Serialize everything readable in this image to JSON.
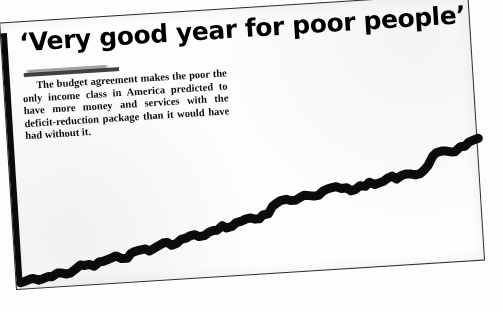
{
  "document": {
    "type": "newspaper-clipping-scan",
    "headline": "‘Very good year for poor people’",
    "byline": "",
    "byline_state": "smudged-illegible",
    "body_text": "The budget agreement makes the poor the only income class in America predicted to have more money and services with the deficit-reduction package than it would have had without it.",
    "background_color": "#fdfdfb",
    "paper_color": "#fefefe",
    "ink_color": "#0b0b0b"
  },
  "chart_data": {
    "type": "line",
    "title": "",
    "subtitle": "",
    "xlabel": "",
    "ylabel": "",
    "grid": false,
    "legend": null,
    "axis": {
      "y_axis_visible": true,
      "x_axis_visible": false,
      "tick_labels_visible": false
    },
    "style": {
      "line_color": "#0b0b0b",
      "line_width_px": 9,
      "texture": "rough-jagged-halftone"
    },
    "x": [
      0,
      2,
      4,
      6,
      8,
      10,
      12,
      14,
      16,
      18,
      20,
      22,
      24,
      26,
      28,
      30,
      32,
      34,
      36,
      38,
      40,
      42,
      44,
      46,
      48,
      50,
      52,
      54,
      56,
      58,
      60,
      62,
      64,
      66,
      68,
      70,
      72,
      74,
      76,
      78,
      80,
      82,
      84,
      86,
      88,
      90,
      92,
      94,
      96,
      98,
      100
    ],
    "values": [
      4,
      6,
      5,
      7,
      9,
      8,
      11,
      13,
      12,
      15,
      17,
      16,
      19,
      21,
      20,
      23,
      25,
      24,
      27,
      29,
      28,
      31,
      34,
      33,
      36,
      38,
      37,
      40,
      47,
      49,
      48,
      51,
      50,
      53,
      55,
      54,
      52,
      55,
      57,
      56,
      59,
      58,
      61,
      60,
      63,
      72,
      75,
      74,
      77,
      80,
      82
    ],
    "ylim": [
      0,
      100
    ],
    "xlim": [
      0,
      100
    ]
  }
}
